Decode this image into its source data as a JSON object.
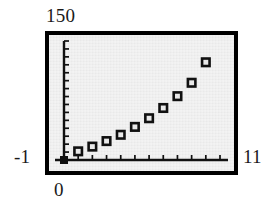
{
  "figure": {
    "background_color": "#ffffff",
    "plot_background_color": "#e9e9e9",
    "frame_color": "#000000",
    "marker_color": "#111111"
  },
  "labels": {
    "y_max": "150",
    "y_min": "-1",
    "x_min": "0",
    "x_max": "11"
  },
  "chart_data": {
    "type": "scatter",
    "title": "",
    "xlabel": "",
    "ylabel": "",
    "xlim": [
      0,
      11
    ],
    "ylim": [
      -1,
      150
    ],
    "grid": false,
    "legend": null,
    "x_tick_labels": [
      "0",
      "11"
    ],
    "y_tick_labels": [
      "-1",
      "150"
    ],
    "x_tick_interval": 1,
    "y_tick_count": 15,
    "series": [
      {
        "name": "data",
        "marker": "open-square",
        "x": [
          1,
          2,
          3,
          4,
          5,
          6,
          7,
          8,
          9,
          10
        ],
        "y": [
          10,
          16,
          23,
          31,
          41,
          52,
          65,
          80,
          97,
          123
        ]
      },
      {
        "name": "origin-point",
        "marker": "filled-square",
        "x": [
          0
        ],
        "y": [
          -1
        ]
      }
    ]
  }
}
